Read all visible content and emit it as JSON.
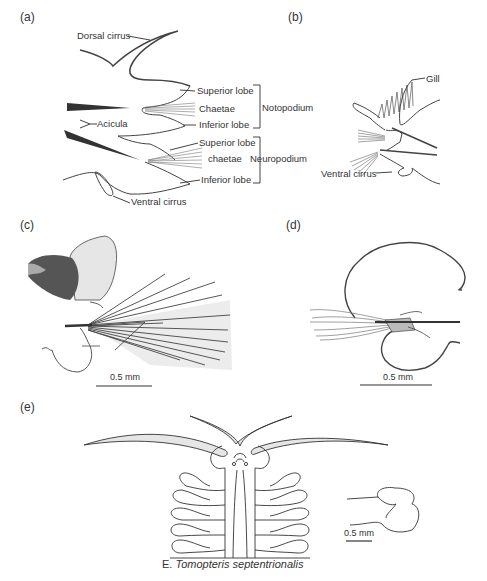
{
  "figure": {
    "caption_prefix": "E.",
    "caption_species": "Tomopteris septentrionalis"
  },
  "panels": {
    "a": {
      "label": "(a)",
      "annotations": {
        "dorsal_cirrus": "Dorsal cirrus",
        "acicula": "Acicula",
        "noto_superior_lobe": "Superior lobe",
        "noto_chaetae": "Chaetae",
        "noto_inferior_lobe": "Inferior lobe",
        "notopodium": "Notopodium",
        "neuro_superior_lobe": "Superior lobe",
        "neuro_chaetae": "chaetae",
        "neuro_inferior_lobe": "Inferior lobe",
        "neuropodium": "Neuropodium",
        "ventral_cirrus": "Ventral cirrus"
      }
    },
    "b": {
      "label": "(b)",
      "annotations": {
        "gill": "Gill",
        "ventral_cirrus": "Ventral cirrus"
      }
    },
    "c": {
      "label": "(c)",
      "scale_bar": "0.5 mm"
    },
    "d": {
      "label": "(d)",
      "scale_bar": "0.5 mm"
    },
    "e": {
      "label": "(e)",
      "scale_bar": "0.5 mm"
    }
  },
  "colors": {
    "line": "#444444",
    "fill_light": "#e6e6e6",
    "fill_dark": "#333333"
  }
}
